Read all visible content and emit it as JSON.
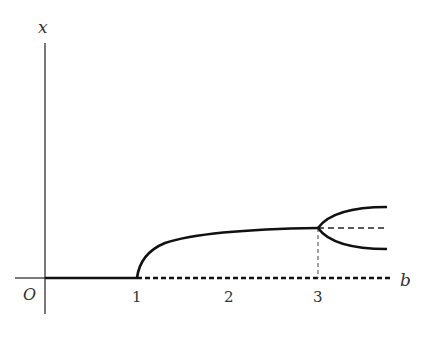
{
  "diagram": {
    "axes": {
      "y_label": "x",
      "x_label": "b",
      "origin_label": "O",
      "x_ticks": [
        "1",
        "2",
        "3"
      ]
    },
    "curves": [
      {
        "name": "stable-zero-branch",
        "from_b": 0,
        "to_b": 1,
        "style": "solid"
      },
      {
        "name": "unstable-zero-branch",
        "from_b": 1,
        "to_b": 3.7,
        "style": "dashed"
      },
      {
        "name": "stable-sqrt-branch",
        "from_b": 1,
        "to_b": 3,
        "style": "solid"
      },
      {
        "name": "unstable-middle-branch",
        "from_b": 3,
        "to_b": 3.7,
        "style": "dashed"
      },
      {
        "name": "upper-pitchfork-branch",
        "from_b": 3,
        "to_b": 3.7,
        "style": "solid"
      },
      {
        "name": "lower-pitchfork-branch",
        "from_b": 3,
        "to_b": 3.7,
        "style": "solid"
      },
      {
        "name": "b3-guide-line",
        "at_b": 3,
        "style": "thin-dashed"
      }
    ],
    "colors": {
      "stroke": "#111111",
      "text": "#333333"
    }
  }
}
